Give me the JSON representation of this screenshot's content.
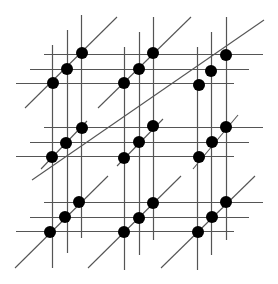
{
  "diagram": {
    "colors": {
      "background": "#ffffff",
      "line": "#555555",
      "dot": "#000000"
    },
    "dot_radius": 6,
    "blocks": [
      {
        "id": "r0c0",
        "vx": [
          52,
          67,
          81
        ],
        "hy": [
          54,
          69,
          83
        ],
        "v_ranges": [
          [
            45,
            268
          ],
          [
            30,
            253
          ],
          [
            15,
            238
          ]
        ],
        "h_ranges": [
          [
            16,
            234
          ],
          [
            30,
            249
          ],
          [
            44,
            263
          ]
        ],
        "diag": [
          [
            25,
            108
          ],
          [
            117,
            17
          ]
        ]
      },
      {
        "id": "r0c1",
        "vx": [
          124,
          139,
          153
        ],
        "hy": [
          54,
          69,
          83
        ],
        "diag": [
          [
            98,
            108
          ],
          [
            191,
            17
          ]
        ]
      },
      {
        "id": "r0c2",
        "vx": [
          197,
          211,
          226
        ],
        "hy": [
          54,
          69,
          83
        ],
        "diag": [
          [
            170,
            110
          ],
          [
            264,
            20
          ]
        ]
      },
      {
        "id": "r1c0",
        "vx": [
          52,
          67,
          81
        ],
        "hy": [
          127,
          142,
          156
        ],
        "diag": [
          [
            41,
            169
          ],
          [
            87,
            121
          ]
        ]
      },
      {
        "id": "r1c1",
        "vx": [
          124,
          139,
          153
        ],
        "hy": [
          127,
          142,
          156
        ],
        "diag": [
          [
            117,
            166
          ],
          [
            163,
            119
          ]
        ]
      },
      {
        "id": "r1c2",
        "vx": [
          197,
          211,
          226
        ],
        "hy": [
          127,
          142,
          156
        ],
        "diag": [
          [
            193,
            169
          ],
          [
            238,
            115
          ]
        ]
      },
      {
        "id": "r2c0",
        "vx": [
          52,
          67,
          81
        ],
        "hy": [
          202,
          217,
          231
        ],
        "diag": [
          [
            15,
            268
          ],
          [
            108,
            176
          ]
        ]
      },
      {
        "id": "r2c1",
        "vx": [
          124,
          139,
          153
        ],
        "hy": [
          202,
          217,
          231
        ],
        "diag": [
          [
            88,
            268
          ],
          [
            181,
            176
          ]
        ]
      },
      {
        "id": "r2c2",
        "vx": [
          197,
          211,
          226
        ],
        "hy": [
          202,
          217,
          231
        ],
        "diag": [
          [
            161,
            268
          ],
          [
            255,
            176
          ]
        ]
      }
    ],
    "vertical_lines": [
      {
        "x": 52,
        "y1": 45,
        "y2": 268
      },
      {
        "x": 67,
        "y1": 30,
        "y2": 253
      },
      {
        "x": 81,
        "y1": 15,
        "y2": 238
      },
      {
        "x": 124,
        "y1": 47,
        "y2": 270
      },
      {
        "x": 139,
        "y1": 32,
        "y2": 255
      },
      {
        "x": 153,
        "y1": 17,
        "y2": 240
      },
      {
        "x": 197,
        "y1": 47,
        "y2": 270
      },
      {
        "x": 211,
        "y1": 32,
        "y2": 255
      },
      {
        "x": 226,
        "y1": 17,
        "y2": 240
      }
    ],
    "horizontal_lines": [
      {
        "y": 54,
        "x1": 44,
        "x2": 263
      },
      {
        "y": 69,
        "x1": 30,
        "x2": 249
      },
      {
        "y": 83,
        "x1": 16,
        "x2": 234
      },
      {
        "y": 127,
        "x1": 44,
        "x2": 263
      },
      {
        "y": 142,
        "x1": 30,
        "x2": 249
      },
      {
        "y": 156,
        "x1": 16,
        "x2": 234
      },
      {
        "y": 202,
        "x1": 44,
        "x2": 263
      },
      {
        "y": 217,
        "x1": 30,
        "x2": 249
      },
      {
        "y": 231,
        "x1": 16,
        "x2": 234
      }
    ],
    "diagonal_lines": [
      {
        "x1": 25,
        "y1": 108,
        "x2": 117,
        "y2": 17
      },
      {
        "x1": 98,
        "y1": 108,
        "x2": 191,
        "y2": 17
      },
      {
        "x1": 32,
        "y1": 180,
        "x2": 264,
        "y2": 20
      },
      {
        "x1": 41,
        "y1": 169,
        "x2": 87,
        "y2": 121
      },
      {
        "x1": 117,
        "y1": 166,
        "x2": 163,
        "y2": 119
      },
      {
        "x1": 193,
        "y1": 169,
        "x2": 238,
        "y2": 115
      },
      {
        "x1": 15,
        "y1": 268,
        "x2": 108,
        "y2": 176
      },
      {
        "x1": 88,
        "y1": 268,
        "x2": 181,
        "y2": 176
      },
      {
        "x1": 161,
        "y1": 268,
        "x2": 255,
        "y2": 176
      }
    ],
    "dots": [
      {
        "x": 53,
        "y": 83
      },
      {
        "x": 67,
        "y": 69
      },
      {
        "x": 82,
        "y": 53
      },
      {
        "x": 124,
        "y": 83
      },
      {
        "x": 139,
        "y": 69
      },
      {
        "x": 153,
        "y": 53
      },
      {
        "x": 199,
        "y": 85
      },
      {
        "x": 211,
        "y": 71
      },
      {
        "x": 226,
        "y": 55
      },
      {
        "x": 52,
        "y": 157
      },
      {
        "x": 66,
        "y": 143
      },
      {
        "x": 82,
        "y": 128
      },
      {
        "x": 124,
        "y": 158
      },
      {
        "x": 139,
        "y": 142
      },
      {
        "x": 153,
        "y": 126
      },
      {
        "x": 199,
        "y": 157
      },
      {
        "x": 212,
        "y": 142
      },
      {
        "x": 226,
        "y": 127
      },
      {
        "x": 50,
        "y": 232
      },
      {
        "x": 65,
        "y": 217
      },
      {
        "x": 79,
        "y": 202
      },
      {
        "x": 124,
        "y": 232
      },
      {
        "x": 139,
        "y": 218
      },
      {
        "x": 153,
        "y": 203
      },
      {
        "x": 198,
        "y": 232
      },
      {
        "x": 212,
        "y": 217
      },
      {
        "x": 226,
        "y": 202
      }
    ]
  }
}
